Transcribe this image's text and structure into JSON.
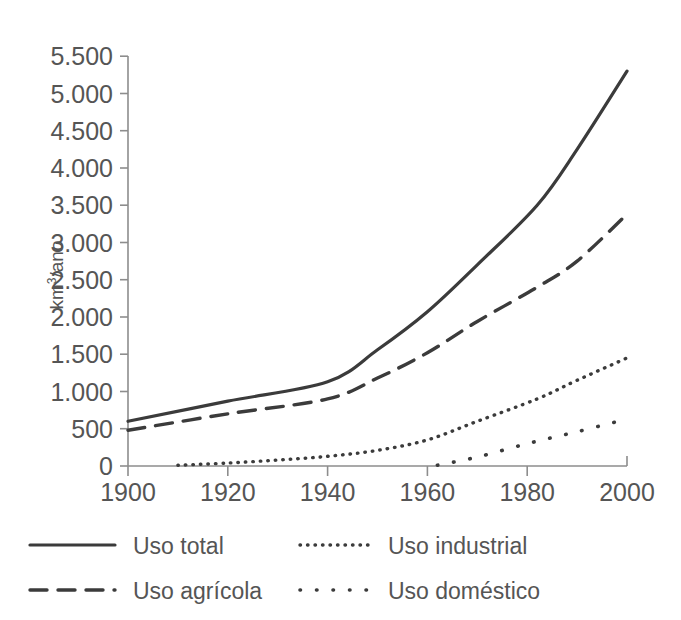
{
  "chart_data": {
    "type": "line",
    "title": "",
    "xlabel": "",
    "ylabel": "km3/ano",
    "ylabel_base": "km",
    "ylabel_sup": "3",
    "ylabel_rest": "/ano",
    "xlim": [
      1900,
      2000
    ],
    "ylim": [
      0,
      5500
    ],
    "grid": false,
    "legend_position": "below-plot",
    "x_ticks": [
      1900,
      1920,
      1940,
      1960,
      1980,
      2000
    ],
    "x_tick_labels": [
      "1900",
      "1920",
      "1940",
      "1960",
      "1980",
      "2000"
    ],
    "y_ticks": [
      0,
      500,
      1000,
      1500,
      2000,
      2500,
      3000,
      3500,
      4000,
      4500,
      5000,
      5500
    ],
    "y_tick_labels": [
      "0",
      "500",
      "1.000",
      "1.500",
      "2.000",
      "2.500",
      "3.000",
      "3.500",
      "4.000",
      "4.500",
      "5.000",
      "5.500"
    ],
    "series": [
      {
        "name": "Uso total",
        "style": "solid",
        "color": "#3b3b3b",
        "x": [
          1900,
          1920,
          1940,
          1950,
          1960,
          1970,
          1982,
          1990,
          2000
        ],
        "values": [
          600,
          870,
          1130,
          1560,
          2070,
          2700,
          3500,
          4250,
          5300
        ]
      },
      {
        "name": "Uso agrícola",
        "style": "dashed",
        "color": "#3b3b3b",
        "x": [
          1900,
          1920,
          1940,
          1950,
          1960,
          1970,
          1982,
          1990,
          2000
        ],
        "values": [
          480,
          700,
          900,
          1180,
          1520,
          1940,
          2400,
          2750,
          3380
        ]
      },
      {
        "name": "Uso industrial",
        "style": "dotted-fine",
        "color": "#3b3b3b",
        "x": [
          1910,
          1920,
          1930,
          1940,
          1950,
          1960,
          1970,
          1982,
          1990,
          2000
        ],
        "values": [
          10,
          40,
          80,
          130,
          210,
          350,
          600,
          900,
          1150,
          1450
        ]
      },
      {
        "name": "Uso doméstico",
        "style": "dotted-sparse",
        "color": "#3b3b3b",
        "x": [
          1962,
          1970,
          1980,
          1990,
          2000
        ],
        "values": [
          10,
          120,
          300,
          460,
          630
        ]
      }
    ]
  },
  "legend": {
    "items": [
      {
        "label": "Uso total",
        "style": "solid"
      },
      {
        "label": "Uso industrial",
        "style": "dotted-fine"
      },
      {
        "label": "Uso agrícola",
        "style": "dashed"
      },
      {
        "label": "Uso doméstico",
        "style": "dotted-sparse"
      }
    ]
  }
}
